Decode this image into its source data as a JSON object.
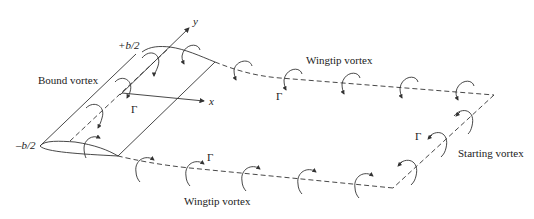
{
  "labels": {
    "bound_vortex": "Bound vortex",
    "wingtip_vortex_top": "Wingtip vortex",
    "wingtip_vortex_bottom": "Wingtip vortex",
    "starting_vortex": "Starting vortex",
    "plus_half_span": "+b/2",
    "minus_half_span": "–b/2",
    "axis_x": "x",
    "axis_y": "y",
    "gamma_bound": "Γ",
    "gamma_top": "Γ",
    "gamma_bottom": "Γ",
    "gamma_starting": "Γ"
  },
  "colors": {
    "line": "#333333",
    "text": "#222222",
    "background": "#ffffff"
  }
}
